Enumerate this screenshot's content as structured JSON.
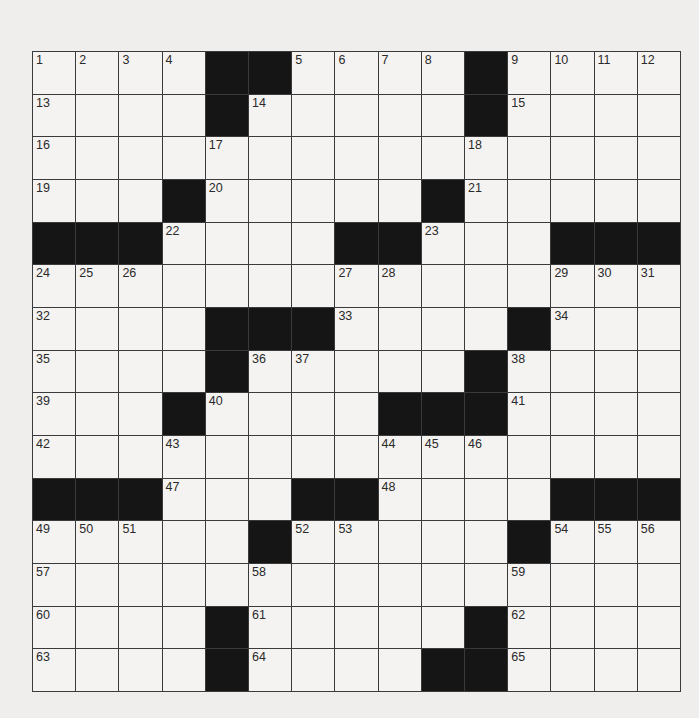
{
  "puzzle": {
    "rows": 15,
    "cols": 15,
    "layout": [
      "....##....#....",
      "....#.....#....",
      "...............",
      "...#.....#.....",
      "###....##...###",
      "...............",
      "....###....#...",
      "....#.....#....",
      "...#....###....",
      "...............",
      "###...##....###",
      ".....#.....#...",
      "...............",
      "....#.....#....",
      "....#....##...."
    ],
    "numbers": [
      [
        1,
        2,
        3,
        4,
        0,
        0,
        5,
        6,
        7,
        8,
        0,
        9,
        10,
        11,
        12
      ],
      [
        13,
        0,
        0,
        0,
        0,
        14,
        0,
        0,
        0,
        0,
        0,
        15,
        0,
        0,
        0
      ],
      [
        16,
        0,
        0,
        0,
        17,
        0,
        0,
        0,
        0,
        0,
        18,
        0,
        0,
        0,
        0
      ],
      [
        19,
        0,
        0,
        0,
        20,
        0,
        0,
        0,
        0,
        0,
        21,
        0,
        0,
        0,
        0
      ],
      [
        0,
        0,
        0,
        22,
        0,
        0,
        0,
        0,
        0,
        23,
        0,
        0,
        0,
        0,
        0
      ],
      [
        24,
        25,
        26,
        0,
        0,
        0,
        0,
        27,
        28,
        0,
        0,
        0,
        29,
        30,
        31
      ],
      [
        32,
        0,
        0,
        0,
        0,
        0,
        0,
        33,
        0,
        0,
        0,
        0,
        34,
        0,
        0
      ],
      [
        35,
        0,
        0,
        0,
        0,
        36,
        37,
        0,
        0,
        0,
        0,
        38,
        0,
        0,
        0
      ],
      [
        39,
        0,
        0,
        0,
        40,
        0,
        0,
        0,
        0,
        0,
        0,
        41,
        0,
        0,
        0
      ],
      [
        42,
        0,
        0,
        43,
        0,
        0,
        0,
        0,
        44,
        45,
        46,
        0,
        0,
        0,
        0
      ],
      [
        0,
        0,
        0,
        47,
        0,
        0,
        0,
        0,
        48,
        0,
        0,
        0,
        0,
        0,
        0
      ],
      [
        49,
        50,
        51,
        0,
        0,
        0,
        52,
        53,
        0,
        0,
        0,
        0,
        54,
        55,
        56
      ],
      [
        57,
        0,
        0,
        0,
        0,
        58,
        0,
        0,
        0,
        0,
        0,
        59,
        0,
        0,
        0
      ],
      [
        60,
        0,
        0,
        0,
        0,
        61,
        0,
        0,
        0,
        0,
        0,
        62,
        0,
        0,
        0
      ],
      [
        63,
        0,
        0,
        0,
        0,
        64,
        0,
        0,
        0,
        0,
        0,
        65,
        0,
        0,
        0
      ]
    ],
    "colors": {
      "black_square": "#151515",
      "white_square": "#f4f3f1",
      "grid_line": "#3a3a3a",
      "background": "#efeeec"
    }
  }
}
